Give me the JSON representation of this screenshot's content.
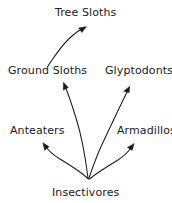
{
  "diagram": {
    "type": "phylogenetic-tree",
    "title": "",
    "background_color": "#ffffff",
    "line_color": "#1a1a1a",
    "text_color": "#1a1a1a",
    "nodes": [
      {
        "id": "tree-sloths",
        "label": "Tree Sloths",
        "x": 55,
        "y": 7,
        "level": 0
      },
      {
        "id": "ground-sloths",
        "label": "Ground Sloths",
        "x": 8,
        "y": 65,
        "level": 1
      },
      {
        "id": "glyptodonts",
        "label": "Glyptodonts",
        "x": 105,
        "y": 65,
        "level": 1
      },
      {
        "id": "anteaters",
        "label": "Anteaters",
        "x": 10,
        "y": 125,
        "level": 2
      },
      {
        "id": "armadillos",
        "label": "Armadillos",
        "x": 117,
        "y": 125,
        "level": 2
      },
      {
        "id": "insectivores",
        "label": "Insectivores",
        "x": 52,
        "y": 187,
        "level": 3
      }
    ],
    "edges": [
      {
        "id": "edge-ground-sloths-to-tree-sloths",
        "from": "ground-sloths",
        "to": "tree-sloths",
        "style": "curved-arrow"
      },
      {
        "id": "edge-insectivores-to-ground-sloths",
        "from": "insectivores",
        "to": "ground-sloths",
        "style": "curved-arrow"
      },
      {
        "id": "edge-insectivores-to-glyptodonts",
        "from": "insectivores",
        "to": "glyptodonts",
        "style": "curved-arrow"
      },
      {
        "id": "edge-insectivores-to-anteaters",
        "from": "insectivores",
        "to": "anteaters",
        "style": "curved-arrow"
      },
      {
        "id": "edge-insectivores-to-armadillos",
        "from": "insectivores",
        "to": "armadillos",
        "style": "curved-arrow"
      }
    ]
  }
}
